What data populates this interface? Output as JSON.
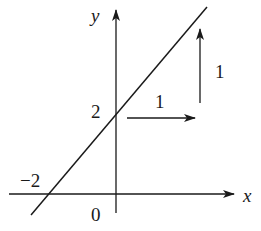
{
  "diagram": {
    "type": "line-graph",
    "axes": {
      "x_label": "x",
      "y_label": "y",
      "origin_label": "0"
    },
    "line": {
      "equation": "y = x + 2",
      "slope": 1,
      "y_intercept": 2,
      "x_intercept": -2
    },
    "labels": {
      "y_intercept": "2",
      "x_intercept": "−2",
      "run": "1",
      "rise": "1"
    },
    "colors": {
      "ink": "#1a1a1a",
      "background": "#ffffff"
    }
  }
}
